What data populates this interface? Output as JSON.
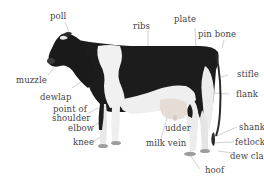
{
  "diagram": {
    "colors": {
      "background": "#ffffff",
      "label_text": "#444444",
      "leader_line": "#aaaaaa",
      "coat_black": "#1a1a1a",
      "coat_white": "#f2f2f2"
    },
    "labels": {
      "poll": "poll",
      "ribs": "ribs",
      "plate": "plate",
      "pin_bone": "pin bone",
      "muzzle": "muzzle",
      "stifle": "stifle",
      "dewlap": "dewlap",
      "flank": "flank",
      "point_of_shoulder_1": "point of",
      "point_of_shoulder_2": "shoulder",
      "elbow": "elbow",
      "knee": "knee",
      "udder": "udder",
      "milk_vein": "milk vein",
      "shank": "shank",
      "fetlock": "fetlock",
      "dew_claw": "dew cla",
      "hoof": "hoof"
    }
  }
}
